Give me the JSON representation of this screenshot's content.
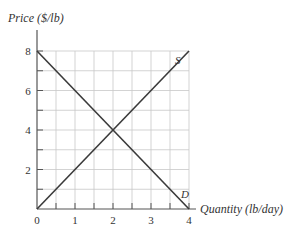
{
  "chart_data": {
    "type": "line",
    "title": "",
    "xlabel": "Quantity (lb/day)",
    "ylabel": "Price ($/lb)",
    "xlim": [
      0,
      4
    ],
    "ylim": [
      0,
      8
    ],
    "x_ticks": [
      "0",
      "1",
      "2",
      "3",
      "4"
    ],
    "y_ticks": [
      "2",
      "4",
      "6",
      "8"
    ],
    "grid": true,
    "grid_step": {
      "x": 0.5,
      "y": 1
    },
    "series": [
      {
        "name": "S",
        "label": "S",
        "x": [
          0,
          4
        ],
        "y": [
          0,
          8
        ]
      },
      {
        "name": "D",
        "label": "D",
        "x": [
          0,
          4
        ],
        "y": [
          8,
          0
        ]
      }
    ],
    "equilibrium": {
      "x": 2,
      "y": 4
    }
  },
  "axes": {
    "ylabel": "Price ($/lb)",
    "xlabel": "Quantity (lb/day)",
    "origin_label": "0"
  },
  "colors": {
    "line": "#3a3a3a",
    "grid": "#c8c8c8",
    "axis": "#555555"
  }
}
